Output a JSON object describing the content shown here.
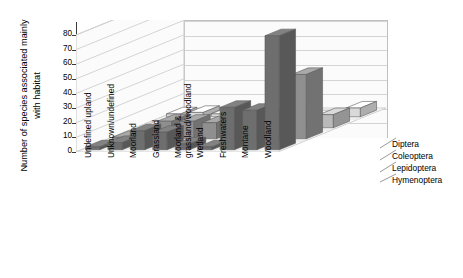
{
  "chart_data": {
    "type": "bar",
    "subtype": "3d-grouped-bar",
    "title": "",
    "xlabel": "",
    "ylabel": "Number of species associated mainly with habitat",
    "ylim": [
      0,
      80
    ],
    "ytick_step": 10,
    "yticks": [
      "0",
      "10",
      "20",
      "30",
      "40",
      "50",
      "60",
      "70",
      "80"
    ],
    "grid": true,
    "legend_position": "right",
    "categories": [
      "Undefined upland",
      "Unknown/undefined",
      "Moorland",
      "Grassland",
      "Moorland & grassland/woodland",
      "Wetland",
      "Freshwaters",
      "Montane",
      "Woodland"
    ],
    "series": [
      {
        "name": "Diptera",
        "color": "#6e6e6e",
        "values": [
          2,
          5,
          13,
          12,
          4,
          2,
          29,
          27,
          78
        ]
      },
      {
        "name": "Coleoptera",
        "color": "#8f8f8f",
        "values": [
          1,
          3,
          12,
          12,
          11,
          2,
          12,
          17,
          44
        ]
      },
      {
        "name": "Lepidoptera",
        "color": "#b9b9b9",
        "values": [
          0,
          0,
          0,
          2,
          2,
          0,
          2,
          4,
          9
        ]
      },
      {
        "name": "Hymenoptera",
        "color": "#d9d9d9",
        "values": [
          2,
          3,
          2,
          2,
          0,
          0,
          0,
          1,
          6
        ]
      }
    ]
  },
  "legend": {
    "items": [
      "Diptera",
      "Coleoptera",
      "Lepidoptera",
      "Hymenoptera"
    ]
  },
  "axes": {
    "y_title": "Number of species associated mainly with habitat"
  },
  "colors": {
    "bar_front_dark": "#6e6e6e",
    "bar_front_mid": "#8f8f8f",
    "bar_front_light": "#b9b9b9",
    "bar_front_pale": "#d9d9d9",
    "wall": "#fbfbfb",
    "gridline": "#d4d4d4",
    "axis": "#3a3a3a",
    "text": "#000000"
  }
}
